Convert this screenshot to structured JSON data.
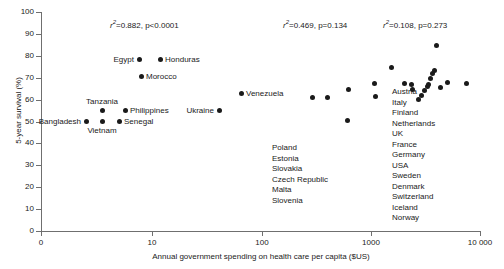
{
  "chart_data": {
    "type": "scatter",
    "title": "",
    "xlabel": "Annual government spending on health care per capita ($US)",
    "ylabel": "5-year survival (%)",
    "x_scale": "log",
    "xlim": [
      3,
      10000
    ],
    "ylim": [
      0,
      100
    ],
    "x_ticks": [
      {
        "label": "0",
        "value": 0
      },
      {
        "label": "10",
        "value": 10
      },
      {
        "label": "100",
        "value": 100
      },
      {
        "label": "1000",
        "value": 1000
      },
      {
        "label": "10 000",
        "value": 10000
      }
    ],
    "y_ticks": [
      "0",
      "10",
      "20",
      "30",
      "40",
      "50",
      "60",
      "70",
      "80",
      "90",
      "100"
    ],
    "grid": false,
    "legend": "none",
    "annotations": [
      {
        "name": "low-income-stats",
        "rsq_value": "0.882",
        "p_value": "p<0.0001",
        "text": "r2=0.882, p<0.0001",
        "x_px": 110,
        "y_px": 18
      },
      {
        "name": "middle-income-stats",
        "rsq_value": "0.469",
        "p_value": "p=0.134",
        "text": "r2=0.469, p=0.134",
        "x_px": 283,
        "y_px": 18
      },
      {
        "name": "high-income-stats",
        "rsq_value": "0.108",
        "p_value": "p=0.273",
        "text": "r2=0.108, p=0.273",
        "x_px": 383,
        "y_px": 18
      }
    ],
    "labeled_points": [
      {
        "name": "Bangladesh",
        "x": 5.9,
        "y": 5,
        "label_pos": "left",
        "px": 86,
        "py": 121
      },
      {
        "name": "Vietnam",
        "x": 8.2,
        "y": 5,
        "label_pos": "below",
        "px": 102,
        "py": 121
      },
      {
        "name": "Tanzania",
        "x": 8.2,
        "y": 10,
        "label_pos": "above",
        "px": 102,
        "py": 110
      },
      {
        "name": "Senegal",
        "x": 11.5,
        "y": 5,
        "label_pos": "right",
        "px": 119,
        "py": 121
      },
      {
        "name": "Philippines",
        "x": 12.0,
        "y": 10,
        "label_pos": "right",
        "px": 125,
        "py": 110
      },
      {
        "name": "Morocco",
        "x": 15.0,
        "y": 30,
        "label_pos": "right",
        "px": 141,
        "py": 76
      },
      {
        "name": "Egypt",
        "x": 14.0,
        "y": 40,
        "label_pos": "left",
        "px": 139,
        "py": 59
      },
      {
        "name": "Honduras",
        "x": 18.5,
        "y": 40,
        "label_pos": "right",
        "px": 160,
        "py": 59
      },
      {
        "name": "Ukraine",
        "x": 22.0,
        "y": 50,
        "label_pos": "left",
        "px": 219,
        "py": 110
      },
      {
        "name": "Venezuela",
        "x": 48.0,
        "y": 60,
        "label_pos": "right",
        "px": 241,
        "py": 93
      }
    ],
    "unlabeled_points_px": [
      [
        312,
        97
      ],
      [
        327,
        97
      ],
      [
        347,
        120
      ],
      [
        348,
        89
      ],
      [
        374,
        83
      ],
      [
        375,
        96
      ],
      [
        391,
        67
      ],
      [
        404,
        83
      ],
      [
        411,
        84
      ],
      [
        412,
        89
      ],
      [
        418,
        99
      ],
      [
        421,
        95
      ],
      [
        424,
        90
      ],
      [
        427,
        86
      ],
      [
        428,
        84
      ],
      [
        430,
        78
      ],
      [
        432,
        73
      ],
      [
        434,
        70
      ],
      [
        436,
        45
      ],
      [
        440,
        87
      ],
      [
        447,
        82
      ],
      [
        466,
        83
      ]
    ],
    "country_group_middle": {
      "name": "middle-income-countries",
      "items": [
        "Poland",
        "Estonia",
        "Slovakia",
        "Czech Republic",
        "Malta",
        "Slovenia"
      ]
    },
    "country_group_high": {
      "name": "high-income-countries",
      "items": [
        "Austria",
        "Italy",
        "Finland",
        "Netherlands",
        "UK",
        "France",
        "Germany",
        "USA",
        "Sweden",
        "Denmark",
        "Switzerland",
        "Iceland",
        "Norway"
      ]
    }
  }
}
